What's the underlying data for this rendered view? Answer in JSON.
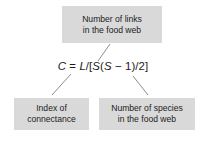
{
  "diagram": {
    "equation": {
      "full_text": "C = L/[S(S − 1)/2]",
      "tokens": {
        "lhs_variable": "C",
        "equals": " = ",
        "numerator_variable": "L",
        "divide_open": "/[",
        "s_first": "S",
        "paren_open": "(",
        "s_second": "S",
        "minus_one": " − 1",
        "paren_close": ")",
        "divide_two": "/2",
        "bracket_close": "]"
      }
    },
    "annotations": [
      {
        "id": "links",
        "name": "number-of-links",
        "lines": [
          "Number of links",
          "in the food web"
        ],
        "points_to": "L"
      },
      {
        "id": "connectance",
        "name": "index-of-connectance",
        "lines": [
          "Index of",
          "connectance"
        ],
        "points_to": "C"
      },
      {
        "id": "species",
        "name": "number-of-species",
        "lines": [
          "Number of species",
          "in the food web"
        ],
        "points_to": "S"
      }
    ],
    "colors": {
      "box_fill": "#d9d9d9",
      "text": "#1c1c1c",
      "connector_line": "#8c8c8c",
      "background": "#ffffff"
    },
    "connectors": [
      {
        "name": "connector-links",
        "x1": 98,
        "y1": 61,
        "x2": 110,
        "y2": 44
      },
      {
        "name": "connector-connectance",
        "x1": 52,
        "y1": 95,
        "x2": 71,
        "y2": 74
      },
      {
        "name": "connector-species",
        "x1": 133,
        "y1": 76,
        "x2": 148,
        "y2": 95
      }
    ]
  }
}
